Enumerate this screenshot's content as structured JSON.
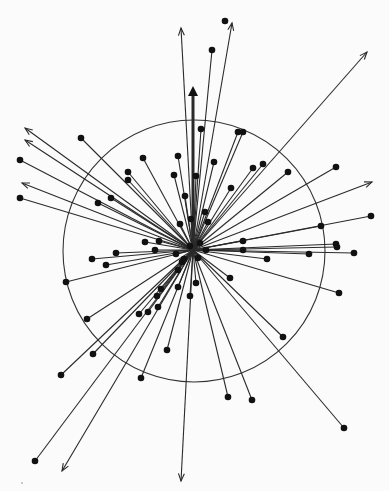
{
  "figure": {
    "title": "",
    "type": "radial vector diagram",
    "width": 389,
    "height": 491,
    "background": "#fbfbfb",
    "line_color": "#2a2a2a",
    "dot_color": "#111111",
    "origin": {
      "x": 193,
      "y": 250
    },
    "circle": {
      "cx": 194,
      "cy": 251,
      "r": 131
    },
    "dot_rays": [
      {
        "x": 212,
        "y": 50
      },
      {
        "x": 81,
        "y": 138
      },
      {
        "x": 20,
        "y": 160
      },
      {
        "x": 20,
        "y": 198
      },
      {
        "x": 128,
        "y": 172
      },
      {
        "x": 128,
        "y": 180
      },
      {
        "x": 143,
        "y": 158
      },
      {
        "x": 178,
        "y": 156
      },
      {
        "x": 174,
        "y": 175
      },
      {
        "x": 201,
        "y": 129
      },
      {
        "x": 238,
        "y": 132
      },
      {
        "x": 243,
        "y": 132
      },
      {
        "x": 98,
        "y": 203
      },
      {
        "x": 111,
        "y": 198
      },
      {
        "x": 214,
        "y": 162
      },
      {
        "x": 231,
        "y": 188
      },
      {
        "x": 253,
        "y": 168
      },
      {
        "x": 263,
        "y": 164
      },
      {
        "x": 288,
        "y": 172
      },
      {
        "x": 336,
        "y": 167
      },
      {
        "x": 371,
        "y": 216
      },
      {
        "x": 321,
        "y": 226
      },
      {
        "x": 336,
        "y": 244
      },
      {
        "x": 337,
        "y": 247
      },
      {
        "x": 354,
        "y": 253
      },
      {
        "x": 309,
        "y": 254
      },
      {
        "x": 243,
        "y": 241
      },
      {
        "x": 243,
        "y": 250
      },
      {
        "x": 92,
        "y": 259
      },
      {
        "x": 106,
        "y": 265
      },
      {
        "x": 116,
        "y": 253
      },
      {
        "x": 66,
        "y": 282
      },
      {
        "x": 267,
        "y": 259
      },
      {
        "x": 339,
        "y": 293
      },
      {
        "x": 230,
        "y": 278
      },
      {
        "x": 283,
        "y": 337
      },
      {
        "x": 344,
        "y": 428
      },
      {
        "x": 228,
        "y": 397
      },
      {
        "x": 252,
        "y": 400
      },
      {
        "x": 87,
        "y": 319
      },
      {
        "x": 93,
        "y": 354
      },
      {
        "x": 61,
        "y": 375
      },
      {
        "x": 35,
        "y": 461
      },
      {
        "x": 141,
        "y": 378
      },
      {
        "x": 167,
        "y": 350
      },
      {
        "x": 139,
        "y": 314
      },
      {
        "x": 148,
        "y": 312
      },
      {
        "x": 158,
        "y": 307
      },
      {
        "x": 157,
        "y": 296
      },
      {
        "x": 161,
        "y": 289
      },
      {
        "x": 178,
        "y": 287
      },
      {
        "x": 190,
        "y": 296
      },
      {
        "x": 196,
        "y": 283
      },
      {
        "x": 159,
        "y": 241
      },
      {
        "x": 155,
        "y": 250
      },
      {
        "x": 145,
        "y": 242
      },
      {
        "x": 185,
        "y": 196
      },
      {
        "x": 196,
        "y": 176
      },
      {
        "x": 191,
        "y": 219
      },
      {
        "x": 180,
        "y": 224
      },
      {
        "x": 178,
        "y": 270
      },
      {
        "x": 182,
        "y": 262
      },
      {
        "x": 184,
        "y": 259
      },
      {
        "x": 190,
        "y": 246
      },
      {
        "x": 200,
        "y": 243
      },
      {
        "x": 206,
        "y": 250
      },
      {
        "x": 198,
        "y": 258
      },
      {
        "x": 176,
        "y": 254
      },
      {
        "x": 208,
        "y": 222
      },
      {
        "x": 205,
        "y": 212
      }
    ],
    "standalone_dots": [
      {
        "x": 225,
        "y": 21
      }
    ],
    "arrow_rays": [
      {
        "x": 181,
        "y": 28
      },
      {
        "x": 232,
        "y": 23
      },
      {
        "x": 367,
        "y": 52
      },
      {
        "x": 372,
        "y": 182
      },
      {
        "x": 25,
        "y": 128
      },
      {
        "x": 25,
        "y": 140
      },
      {
        "x": 22,
        "y": 183
      },
      {
        "x": 62,
        "y": 471
      },
      {
        "x": 181,
        "y": 481
      }
    ],
    "thick_arrow": {
      "x": 193,
      "y": 90
    },
    "specks": [
      {
        "x": 22,
        "y": 483
      }
    ]
  }
}
